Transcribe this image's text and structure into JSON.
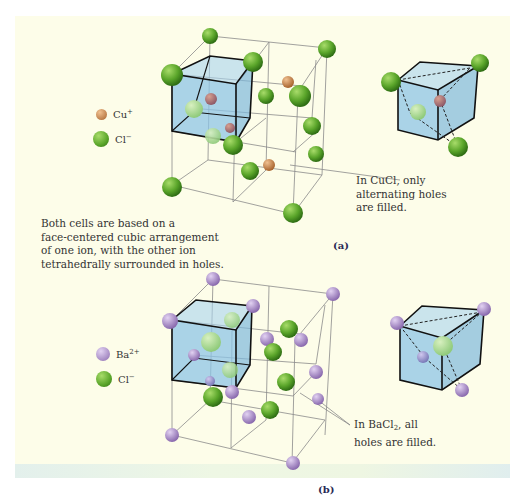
{
  "figure_a": {
    "label": "(a)",
    "legend": [
      {
        "ion": "Cu",
        "charge": "+",
        "color": "#c9884e"
      },
      {
        "ion": "Cl",
        "charge": "−",
        "color": "#5aa52a"
      }
    ],
    "callout": {
      "line1": "In CuCl, only",
      "line2": "alternating holes",
      "line3": "are filled."
    }
  },
  "figure_b": {
    "label": "(b)",
    "legend": [
      {
        "ion": "Ba",
        "charge": "2+",
        "color": "#a88cc8"
      },
      {
        "ion": "Cl",
        "charge": "−",
        "color": "#5aa52a"
      }
    ],
    "callout": {
      "line1_pre": "In BaCl",
      "line1_sub": "2",
      "line1_post": ", all",
      "line2": "holes are filled."
    }
  },
  "description": {
    "line1": "Both cells are based on a",
    "line2": "face-centered cubic arrangement",
    "line3": "of one ion, with the other ion",
    "line4": "tetrahedrally surrounded in holes."
  },
  "colors": {
    "background": "#fdfde9",
    "unit_cell_fill": "#8ec4e6",
    "chloride": "#5aa52a",
    "copper": "#c9884e",
    "barium": "#a88cc8"
  }
}
